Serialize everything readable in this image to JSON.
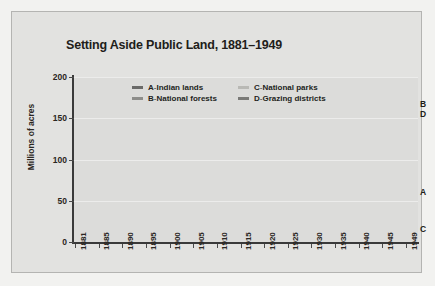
{
  "chart_data": {
    "type": "line",
    "title": "Setting Aside Public Land, 1881–1949",
    "xlabel": "",
    "ylabel": "Millions of acres",
    "ylim": [
      0,
      200
    ],
    "yticks": [
      0,
      50,
      100,
      150,
      200
    ],
    "grid": true,
    "legend_position": "inside-top-center",
    "x": [
      1881,
      1885,
      1890,
      1895,
      1900,
      1905,
      1910,
      1915,
      1920,
      1925,
      1930,
      1935,
      1940,
      1945,
      1949
    ],
    "series": [
      {
        "key": "A",
        "name": "Indian lands",
        "color": "#6a6a68",
        "end_label": "A",
        "values": [
          160,
          158,
          128,
          104,
          90,
          80,
          75,
          72,
          70,
          68,
          65,
          60,
          58,
          60,
          60
        ]
      },
      {
        "key": "B",
        "name": "National forests",
        "color": "#8d8d8a",
        "end_label": "B",
        "values": [
          0,
          0,
          0,
          8,
          24,
          45,
          150,
          155,
          147,
          150,
          153,
          155,
          165,
          165,
          167
        ]
      },
      {
        "key": "C",
        "name": "National parks",
        "color": "#b9b9b5",
        "end_label": "C",
        "values": [
          1,
          1,
          2,
          2,
          3,
          4,
          5,
          6,
          7,
          8,
          9,
          10,
          13,
          14,
          15
        ]
      },
      {
        "key": "D",
        "name": "Grazing districts",
        "color": "#7a7a77",
        "end_label": "D",
        "values": [
          0,
          0,
          0,
          0,
          0,
          0,
          0,
          0,
          0,
          0,
          0,
          28,
          142,
          148,
          155
        ]
      }
    ]
  },
  "legend": {
    "rows": [
      [
        {
          "key": "A",
          "sep": " - ",
          "name": "Indian lands",
          "color": "#6a6a68"
        },
        {
          "key": "C",
          "sep": " - ",
          "name": "National parks",
          "color": "#b9b9b5"
        }
      ],
      [
        {
          "key": "B",
          "sep": " - ",
          "name": "National forests",
          "color": "#8d8d8a"
        },
        {
          "key": "D",
          "sep": " - ",
          "name": "Grazing districts",
          "color": "#7a7a77"
        }
      ]
    ]
  },
  "colors": {
    "page_background": "#f2f2f0",
    "figure_background": "#e2e2e0",
    "plot_background": "#dcdcda",
    "axis": "#3a3a3a",
    "gridline": "#ececeb",
    "text": "#211d1a"
  }
}
